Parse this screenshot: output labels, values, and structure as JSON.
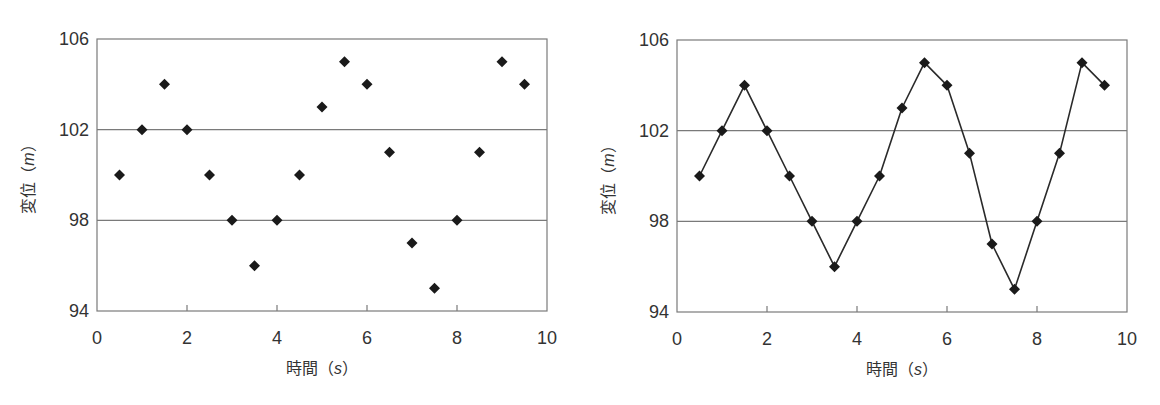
{
  "chart_data": [
    {
      "type": "scatter",
      "title": "",
      "xlabel": "時間（s）",
      "ylabel": "変位（m）",
      "xlim": [
        0,
        10
      ],
      "ylim": [
        94,
        106
      ],
      "xticks": [
        0,
        2,
        4,
        6,
        8,
        10
      ],
      "yticks": [
        94,
        98,
        102,
        106
      ],
      "grid": "horizontal at 98 and 102",
      "legend": null,
      "marker": "diamond",
      "x": [
        0.5,
        1,
        1.5,
        2,
        2.5,
        3,
        3.5,
        4,
        4.5,
        5,
        5.5,
        6,
        6.5,
        7,
        7.5,
        8,
        8.5,
        9,
        9.5
      ],
      "values": [
        100,
        102,
        104,
        102,
        100,
        98,
        96,
        98,
        100,
        103,
        105,
        104,
        101,
        97,
        95,
        98,
        101,
        105,
        104
      ]
    },
    {
      "type": "line",
      "title": "",
      "xlabel": "時間（s）",
      "ylabel": "変位（m）",
      "xlim": [
        0,
        10
      ],
      "ylim": [
        94,
        106
      ],
      "xticks": [
        0,
        2,
        4,
        6,
        8,
        10
      ],
      "yticks": [
        94,
        98,
        102,
        106
      ],
      "grid": "horizontal at 98 and 102",
      "legend": null,
      "marker": "diamond",
      "x": [
        0.5,
        1,
        1.5,
        2,
        2.5,
        3,
        3.5,
        4,
        4.5,
        5,
        5.5,
        6,
        6.5,
        7,
        7.5,
        8,
        8.5,
        9,
        9.5
      ],
      "values": [
        100,
        102,
        104,
        102,
        100,
        98,
        96,
        98,
        100,
        103,
        105,
        104,
        101,
        97,
        95,
        98,
        101,
        105,
        104
      ]
    }
  ],
  "labels": {
    "x_title_main": "時間",
    "x_unit": "s",
    "y_title_main": "変位",
    "y_unit": "m",
    "open_paren": "（",
    "close_paren": "）"
  },
  "colors": {
    "axis": "#7a7a7a",
    "grid": "#7a7a7a",
    "marker": "#1a1a1a",
    "line": "#2a2a2a",
    "text": "#333333"
  },
  "layout": [
    {
      "left": 97,
      "top": 39,
      "width": 450,
      "height": 272
    },
    {
      "left": 677,
      "top": 40,
      "width": 450,
      "height": 272
    }
  ]
}
